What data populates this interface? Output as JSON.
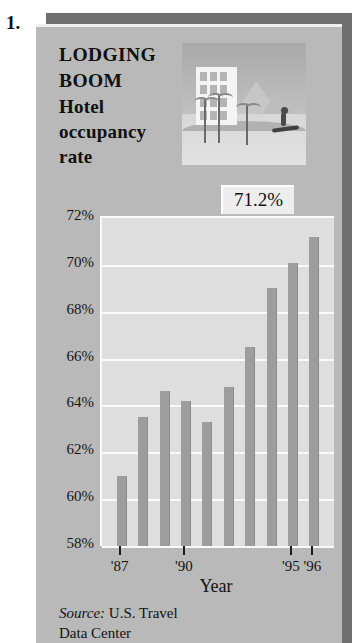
{
  "item_number": "1.",
  "headline": {
    "line1": "LODGING",
    "line2": "BOOM",
    "line3": "Hotel",
    "line4": "occupancy",
    "line5": "rate"
  },
  "callout": {
    "value": "71.2%"
  },
  "photo": {
    "alt": "hotel-beach-photo"
  },
  "source": {
    "label": "Source:",
    "text": " U.S. Travel",
    "line2": "Data Center"
  },
  "chart_data": {
    "type": "bar",
    "title": "LODGING BOOM Hotel occupancy rate",
    "xlabel": "Year",
    "ylabel": "",
    "ylim": [
      58,
      72
    ],
    "grid": true,
    "legend": "none",
    "ytick_labels": [
      "72%",
      "70%",
      "68%",
      "66%",
      "64%",
      "62%",
      "60%",
      "58%"
    ],
    "ytick_values": [
      72,
      70,
      68,
      66,
      64,
      62,
      60,
      58
    ],
    "categories": [
      "'87",
      "'88",
      "'89",
      "'90",
      "'91",
      "'92",
      "'93",
      "'94",
      "'95",
      "'96"
    ],
    "xtick_labels": [
      "'87",
      "'90",
      "'95",
      "'96"
    ],
    "xtick_categories": [
      "'87",
      "'90",
      "'95",
      "'96"
    ],
    "values": [
      61.0,
      63.5,
      64.6,
      64.2,
      63.3,
      64.8,
      66.5,
      69.0,
      70.1,
      71.2
    ],
    "annotations": [
      {
        "text": "71.2%",
        "category": "'96",
        "value": 71.2
      }
    ],
    "bar_color": "#9d9d9d",
    "plot_background": "#dedede",
    "panel_background": "#b9b9b9"
  }
}
